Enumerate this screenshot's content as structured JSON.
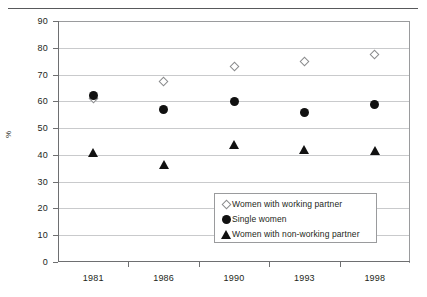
{
  "chart_data": {
    "type": "scatter",
    "title": "",
    "xlabel": "",
    "ylabel": "%",
    "categories": [
      "1981",
      "1986",
      "1990",
      "1993",
      "1998"
    ],
    "ylim": [
      0,
      90
    ],
    "yticks": [
      0,
      10,
      20,
      30,
      40,
      50,
      60,
      70,
      80,
      90
    ],
    "grid": true,
    "legend_position": "inside-lower-right",
    "series": [
      {
        "name": "Women with working partner",
        "marker": "open-diamond",
        "color": "#ffffff",
        "edge_color": "#8a8b8d",
        "values": [
          61,
          67.5,
          73,
          75,
          77.5
        ]
      },
      {
        "name": "Single women",
        "marker": "filled-circle",
        "color": "#111111",
        "edge_color": "#111111",
        "values": [
          62,
          57,
          60,
          56,
          59
        ]
      },
      {
        "name": "Women with non-working partner",
        "marker": "filled-triangle",
        "color": "#111111",
        "edge_color": "#111111",
        "values": [
          41,
          36.5,
          44,
          42,
          41.5
        ]
      }
    ]
  }
}
